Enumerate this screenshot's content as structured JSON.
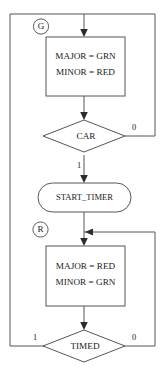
{
  "diagram": {
    "colors": {
      "stroke": "#555555",
      "text": "#1a1a1a",
      "arrow": "#2b2b2b",
      "background": "#ffffff"
    },
    "states": [
      {
        "id": "G",
        "label": "G"
      },
      {
        "id": "R",
        "label": "R"
      }
    ],
    "nodes": [
      {
        "id": "action-green",
        "type": "process",
        "line1": "MAJOR = GRN",
        "line2": "MINOR = RED"
      },
      {
        "id": "decision-car",
        "type": "decision",
        "label": "CAR"
      },
      {
        "id": "start-timer",
        "type": "terminator",
        "label": "START_TIMER"
      },
      {
        "id": "action-red",
        "type": "process",
        "line1": "MAJOR = RED",
        "line2": "MINOR = GRN"
      },
      {
        "id": "decision-timed",
        "type": "decision",
        "label": "TIMED"
      }
    ],
    "edge_labels": {
      "car_false": "0",
      "car_true": "1",
      "timed_false": "0",
      "timed_true": "1"
    }
  }
}
